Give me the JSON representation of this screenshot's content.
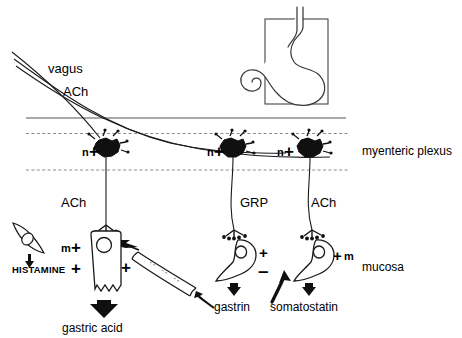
{
  "figure": {
    "title_region": "gastric acid secretion regulation schematic",
    "layers": {
      "myenteric_plexus_label": "myenteric plexus",
      "mucosa_label": "mucosa"
    },
    "nerve": {
      "vagus_label": "vagus",
      "vagus_transmitter": "ACh"
    },
    "plexus_neurons": [
      {
        "receptor": "n",
        "sign": "+"
      },
      {
        "receptor": "n",
        "sign": "+"
      },
      {
        "receptor": "n",
        "sign": "+"
      }
    ],
    "postganglionic_transmitters": [
      {
        "name": "ACh"
      },
      {
        "name": "GRP"
      },
      {
        "name": "ACh"
      }
    ],
    "cells": {
      "ecl": {
        "product": "HISTAMINE",
        "product_sign": "+"
      },
      "parietal": {
        "receptor_m": "m",
        "receptor_m_sign": "+",
        "histamine_sign": "+",
        "gastrin_sign": "+",
        "output": "gastric acid"
      },
      "g_cell": {
        "grp_sign": "+",
        "somatostatin_sign": "–",
        "output": "gastrin"
      },
      "d_cell": {
        "receptor_sign": "+",
        "receptor_m": "m",
        "output": "somatostatin"
      }
    },
    "inset": {
      "name": "stomach-outline"
    },
    "colors": {
      "ink": "#000000",
      "background": "#ffffff",
      "dashed_boundary": "#7a7a7a",
      "solid_boundary": "#555555"
    }
  }
}
